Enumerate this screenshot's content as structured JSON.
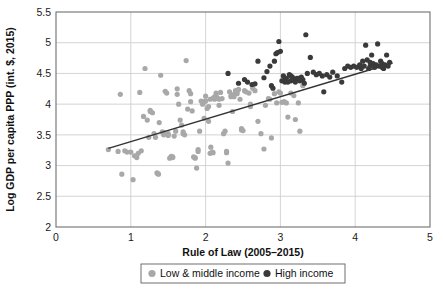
{
  "chart_data": {
    "type": "scatter",
    "title": "",
    "xlabel": "Rule of Law (2005–2015)",
    "ylabel": "Log GDP per capita PPP (int. $, 2015)",
    "xlim": [
      0,
      5
    ],
    "ylim": [
      2,
      5.5
    ],
    "xticks": [
      0,
      1,
      2,
      3,
      4,
      5
    ],
    "yticks": [
      2,
      2.5,
      3,
      3.5,
      4,
      4.5,
      5,
      5.5
    ],
    "xtick_labels": [
      "0",
      "1",
      "2",
      "3",
      "4",
      "5"
    ],
    "ytick_labels": [
      "2",
      "2.5",
      "3",
      "3.5",
      "4",
      "4.5",
      "5",
      "5.5"
    ],
    "grid": true,
    "grid_color": "#cfcfcf",
    "legend_position": "below-axis",
    "series": [
      {
        "name": "Low & middle income",
        "color": "#a8a8a8",
        "marker": "circle",
        "marker_size": 5.2,
        "points": [
          [
            0.7,
            3.26
          ],
          [
            0.83,
            3.23
          ],
          [
            0.86,
            4.16
          ],
          [
            0.88,
            2.86
          ],
          [
            0.92,
            3.24
          ],
          [
            0.95,
            3.22
          ],
          [
            1.0,
            3.22
          ],
          [
            1.03,
            2.77
          ],
          [
            1.05,
            3.16
          ],
          [
            1.08,
            3.13
          ],
          [
            1.1,
            3.2
          ],
          [
            1.12,
            4.19
          ],
          [
            1.14,
            3.24
          ],
          [
            1.17,
            3.8
          ],
          [
            1.19,
            4.58
          ],
          [
            1.22,
            3.74
          ],
          [
            1.24,
            3.46
          ],
          [
            1.26,
            3.9
          ],
          [
            1.29,
            3.86
          ],
          [
            1.31,
            3.52
          ],
          [
            1.33,
            3.46
          ],
          [
            1.35,
            2.88
          ],
          [
            1.37,
            2.86
          ],
          [
            1.38,
            3.7
          ],
          [
            1.4,
            4.47
          ],
          [
            1.42,
            3.55
          ],
          [
            1.44,
            3.54
          ],
          [
            1.46,
            4.21
          ],
          [
            1.48,
            4.18
          ],
          [
            1.5,
            3.52
          ],
          [
            1.52,
            3.12
          ],
          [
            1.54,
            3.15
          ],
          [
            1.56,
            3.13
          ],
          [
            1.58,
            3.48
          ],
          [
            1.6,
            3.56
          ],
          [
            1.62,
            4.25
          ],
          [
            1.64,
            4.0
          ],
          [
            1.66,
            3.74
          ],
          [
            1.68,
            3.66
          ],
          [
            1.7,
            3.52
          ],
          [
            1.72,
            3.5
          ],
          [
            1.74,
            4.71
          ],
          [
            1.76,
            3.92
          ],
          [
            1.78,
            4.22
          ],
          [
            1.8,
            4.17
          ],
          [
            1.82,
            3.89
          ],
          [
            1.84,
            3.14
          ],
          [
            1.86,
            3.13
          ],
          [
            1.88,
            2.96
          ],
          [
            1.9,
            3.26
          ],
          [
            1.92,
            3.56
          ],
          [
            1.94,
            4.05
          ],
          [
            1.96,
            4.0
          ],
          [
            1.98,
            4.04
          ],
          [
            2.0,
            4.13
          ],
          [
            2.02,
            3.93
          ],
          [
            2.04,
            3.72
          ],
          [
            2.06,
            4.08
          ],
          [
            2.07,
            3.3
          ],
          [
            2.09,
            3.22
          ],
          [
            2.1,
            3.21
          ],
          [
            2.12,
            4.08
          ],
          [
            2.14,
            4.18
          ],
          [
            2.16,
            4.1
          ],
          [
            2.18,
            3.98
          ],
          [
            2.2,
            4.19
          ],
          [
            2.22,
            4.09
          ],
          [
            2.24,
            3.52
          ],
          [
            2.26,
            3.56
          ],
          [
            2.28,
            3.23
          ],
          [
            2.3,
            3.04
          ],
          [
            2.32,
            4.2
          ],
          [
            2.34,
            4.14
          ],
          [
            2.36,
            3.88
          ],
          [
            2.38,
            4.12
          ],
          [
            2.4,
            4.22
          ],
          [
            2.42,
            4.17
          ],
          [
            2.44,
            4.24
          ],
          [
            2.46,
            4.08
          ],
          [
            2.48,
            3.6
          ],
          [
            2.5,
            3.57
          ],
          [
            2.54,
            4.2
          ],
          [
            2.58,
            4.18
          ],
          [
            2.6,
            3.96
          ],
          [
            2.63,
            4.26
          ],
          [
            2.66,
            4.22
          ],
          [
            2.7,
            3.72
          ],
          [
            2.74,
            3.52
          ],
          [
            2.78,
            3.27
          ],
          [
            2.8,
            3.98
          ],
          [
            2.84,
            4.09
          ],
          [
            2.88,
            3.45
          ],
          [
            2.92,
            4.17
          ],
          [
            2.95,
            4.02
          ],
          [
            2.98,
            4.2
          ],
          [
            3.02,
            4.03
          ],
          [
            3.05,
            4.04
          ],
          [
            3.08,
            4.02
          ],
          [
            3.1,
            3.79
          ],
          [
            3.14,
            4.18
          ],
          [
            3.18,
            4.14
          ],
          [
            3.2,
            3.75
          ],
          [
            3.24,
            4.02
          ],
          [
            3.26,
            3.56
          ],
          [
            3.3,
            4.3
          ],
          [
            1.44,
            3.5
          ],
          [
            1.98,
            3.77
          ],
          [
            2.06,
            3.2
          ],
          [
            2.12,
            4.12
          ],
          [
            1.62,
            4.16
          ],
          [
            1.9,
            3.23
          ],
          [
            2.42,
            4.18
          ],
          [
            1.5,
            3.49
          ],
          [
            1.36,
            2.87
          ],
          [
            2.0,
            4.05
          ],
          [
            2.6,
            4.0
          ],
          [
            2.18,
            4.08
          ],
          [
            1.8,
            4.04
          ],
          [
            2.48,
            3.58
          ],
          [
            2.86,
            4.08
          ],
          [
            1.7,
            3.55
          ],
          [
            2.04,
            3.96
          ],
          [
            2.34,
            4.12
          ],
          [
            3.0,
            4.18
          ],
          [
            1.26,
            3.88
          ],
          [
            2.28,
            3.21
          ],
          [
            2.1,
            4.1
          ],
          [
            2.52,
            4.22
          ],
          [
            1.56,
            3.14
          ],
          [
            2.38,
            4.16
          ],
          [
            1.86,
            3.12
          ],
          [
            2.14,
            4.14
          ]
        ]
      },
      {
        "name": "High income",
        "color": "#3a3a3a",
        "marker": "circle",
        "marker_size": 5.2,
        "points": [
          [
            2.3,
            4.5
          ],
          [
            2.44,
            4.34
          ],
          [
            2.52,
            4.4
          ],
          [
            2.56,
            4.36
          ],
          [
            2.62,
            4.32
          ],
          [
            2.66,
            4.33
          ],
          [
            2.7,
            4.7
          ],
          [
            2.78,
            4.43
          ],
          [
            2.82,
            4.53
          ],
          [
            2.86,
            4.62
          ],
          [
            2.88,
            4.3
          ],
          [
            2.92,
            4.7
          ],
          [
            2.94,
            4.82
          ],
          [
            2.96,
            4.84
          ],
          [
            2.98,
            5.02
          ],
          [
            3.0,
            4.86
          ],
          [
            3.02,
            4.38
          ],
          [
            3.04,
            4.46
          ],
          [
            3.06,
            4.4
          ],
          [
            3.08,
            4.42
          ],
          [
            3.1,
            4.36
          ],
          [
            3.12,
            4.48
          ],
          [
            3.14,
            4.38
          ],
          [
            3.16,
            4.44
          ],
          [
            3.18,
            4.4
          ],
          [
            3.2,
            4.36
          ],
          [
            3.22,
            4.42
          ],
          [
            3.26,
            4.38
          ],
          [
            3.28,
            4.44
          ],
          [
            3.3,
            4.4
          ],
          [
            3.32,
            4.34
          ],
          [
            3.34,
            5.13
          ],
          [
            3.36,
            4.5
          ],
          [
            3.4,
            4.76
          ],
          [
            3.44,
            4.52
          ],
          [
            3.48,
            4.48
          ],
          [
            3.52,
            4.5
          ],
          [
            3.56,
            4.46
          ],
          [
            3.58,
            4.2
          ],
          [
            3.62,
            4.48
          ],
          [
            3.66,
            4.44
          ],
          [
            3.7,
            4.52
          ],
          [
            3.76,
            4.46
          ],
          [
            3.82,
            4.36
          ],
          [
            3.86,
            4.58
          ],
          [
            3.9,
            4.62
          ],
          [
            3.94,
            4.6
          ],
          [
            3.98,
            4.62
          ],
          [
            4.02,
            4.6
          ],
          [
            4.06,
            4.64
          ],
          [
            4.1,
            4.7
          ],
          [
            4.14,
            4.96
          ],
          [
            4.16,
            4.72
          ],
          [
            4.18,
            4.58
          ],
          [
            4.2,
            4.62
          ],
          [
            4.22,
            4.8
          ],
          [
            4.24,
            4.66
          ],
          [
            4.26,
            4.6
          ],
          [
            4.28,
            4.64
          ],
          [
            4.3,
            4.98
          ],
          [
            4.32,
            4.62
          ],
          [
            4.34,
            4.7
          ],
          [
            4.36,
            4.66
          ],
          [
            4.38,
            4.58
          ],
          [
            4.4,
            4.64
          ],
          [
            4.42,
            4.8
          ],
          [
            4.44,
            4.62
          ],
          [
            4.46,
            4.68
          ],
          [
            3.24,
            4.42
          ],
          [
            3.14,
            4.46
          ],
          [
            3.06,
            4.36
          ],
          [
            2.9,
            4.26
          ],
          [
            4.08,
            4.58
          ],
          [
            4.12,
            4.62
          ],
          [
            4.2,
            4.68
          ],
          [
            4.36,
            4.6
          ]
        ]
      }
    ],
    "trendline": {
      "name": "fitted trend",
      "color": "#333333",
      "width": 1.4,
      "x_start": 0.7,
      "y_start": 3.28,
      "x_end": 4.5,
      "y_end": 4.67
    }
  },
  "legend": {
    "entries": [
      {
        "label": "Low & middle income",
        "color": "#a8a8a8"
      },
      {
        "label": "High income",
        "color": "#3a3a3a"
      }
    ]
  },
  "axes": {
    "x_title": "Rule of Law (2005–2015)",
    "y_title": "Log GDP per capita PPP (int. $, 2015)"
  },
  "colors": {
    "axis": "#6f6f6f",
    "grid": "#cfcfcf",
    "text": "#111111",
    "low_middle_income": "#a8a8a8",
    "high_income": "#3a3a3a",
    "trendline": "#333333",
    "background": "#ffffff"
  }
}
